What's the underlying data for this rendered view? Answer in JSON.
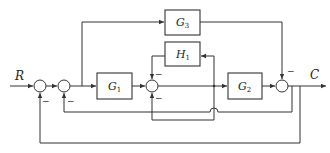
{
  "diagram": {
    "type": "block-diagram",
    "input_label": "R",
    "output_label": "C",
    "blocks": [
      {
        "id": "G1",
        "name": "G",
        "sub": "1"
      },
      {
        "id": "G2",
        "name": "G",
        "sub": "2"
      },
      {
        "id": "G3",
        "name": "G",
        "sub": "3"
      },
      {
        "id": "H1",
        "name": "H",
        "sub": "1"
      }
    ],
    "summing_junctions": [
      {
        "id": "S1",
        "signs": {
          "bottom": "−"
        }
      },
      {
        "id": "S2",
        "signs": {
          "bottom": "−"
        }
      },
      {
        "id": "S3",
        "signs": {
          "top": "−",
          "bottom": "−"
        }
      },
      {
        "id": "S4",
        "signs": {
          "top": "−"
        }
      }
    ],
    "colors": {
      "line": "#333333",
      "background": "#ffffff"
    }
  }
}
